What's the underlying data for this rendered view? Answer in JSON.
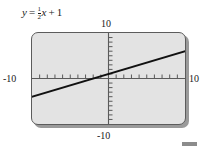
{
  "figure": {
    "equation": {
      "lhs": "y",
      "equals": "=",
      "coefficient_numerator": "1",
      "coefficient_denominator": "2",
      "variable": "x",
      "plus": "+",
      "constant": "1",
      "full_text": "y = 1/2 x + 1"
    },
    "screen": {
      "background_color": "#e3e3e3",
      "border_color": "#5c5c5c",
      "shadow_color": "#9a9a9a"
    },
    "window_labels": {
      "ymax": "10",
      "ymin": "-10",
      "xmin": "-10",
      "xmax": "10"
    },
    "page_marker": {
      "color": "#8c8c8c"
    }
  },
  "chart_data": {
    "type": "line",
    "xlabel": "",
    "ylabel": "",
    "xlim": [
      -10,
      10
    ],
    "ylim": [
      -10,
      10
    ],
    "grid": false,
    "legend": null,
    "axis_color": "#5a5a5a",
    "line_color": "#111111",
    "x_tick_interval": 1,
    "y_tick_interval": 1,
    "x_tick_values": [
      -9,
      -8,
      -7,
      -6,
      -5,
      -4,
      -3,
      -2,
      -1,
      1,
      2,
      3,
      4,
      5,
      6,
      7,
      8,
      9
    ],
    "y_tick_values": [
      -9,
      -8,
      -7,
      -6,
      -5,
      -4,
      -3,
      -2,
      -1,
      1,
      2,
      3,
      4,
      5,
      6,
      7,
      8,
      9
    ],
    "series": [
      {
        "name": "y = 1/2 x + 1",
        "slope": 0.5,
        "intercept": 1,
        "x": [
          -10,
          10
        ],
        "values": [
          -4,
          6
        ]
      }
    ]
  }
}
